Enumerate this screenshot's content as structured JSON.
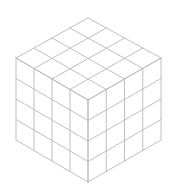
{
  "figure": {
    "type": "isometric-cube-grid",
    "subdivisions": 4,
    "line_color": "#b8b8b8",
    "background": "#ffffff",
    "vertices": {
      "top": [
        88,
        18
      ],
      "left_top": [
        16,
        58
      ],
      "right_top": [
        161,
        58
      ],
      "front_top": [
        88,
        100
      ],
      "left_bottom": [
        16,
        140
      ],
      "right_bottom": [
        161,
        140
      ],
      "bottom": [
        88,
        182
      ]
    }
  }
}
